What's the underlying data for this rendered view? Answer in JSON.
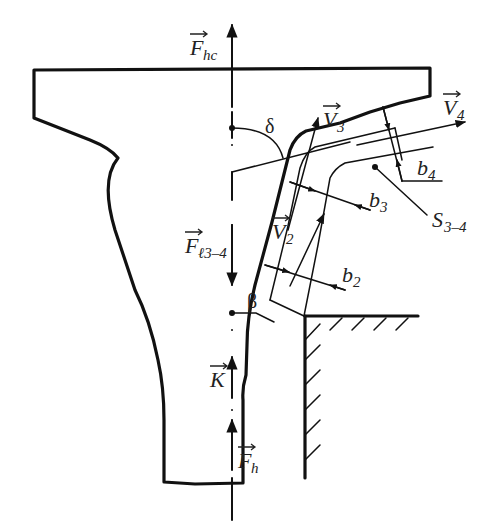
{
  "figure": {
    "type": "blade-jet flow force diagram",
    "labels": {
      "F_hc": {
        "main": "F",
        "sub": "hc",
        "vector": true
      },
      "F_l34": {
        "main": "F",
        "sub": "ℓ3–4",
        "vector": true
      },
      "K": {
        "main": "K",
        "sub": "",
        "vector": true
      },
      "F_h": {
        "main": "F",
        "sub": "h",
        "vector": true
      },
      "V2": {
        "main": "V",
        "sub": "2",
        "vector": true
      },
      "V3": {
        "main": "V",
        "sub": "3",
        "vector": true
      },
      "V4": {
        "main": "V",
        "sub": "4",
        "vector": true
      },
      "b2": {
        "main": "b",
        "sub": "2"
      },
      "b3": {
        "main": "b",
        "sub": "3"
      },
      "b4": {
        "main": "b",
        "sub": "4"
      },
      "S34": {
        "main": "S",
        "sub": "3–4"
      },
      "delta": "δ",
      "beta": "β"
    },
    "colors": {
      "line": "#111111",
      "text": "#222222",
      "background": "#ffffff"
    }
  }
}
